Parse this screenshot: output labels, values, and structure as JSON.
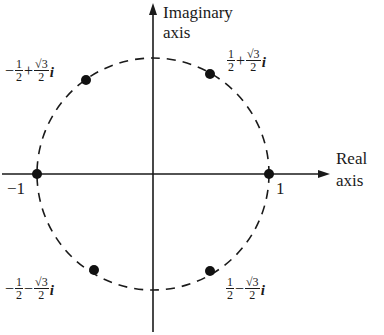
{
  "axes": {
    "imaginary_label_line1": "Imaginary",
    "imaginary_label_line2": "axis",
    "real_label_line1": "Real",
    "real_label_line2": "axis",
    "tick_neg_one": "−1",
    "tick_one": "1"
  },
  "points": [
    {
      "name": "upper-left",
      "real_sign": "−",
      "real_num": "1",
      "real_den": "2",
      "op": "+",
      "imag_num": "√3",
      "imag_den": "2",
      "i": "i"
    },
    {
      "name": "upper-right",
      "real_sign": "",
      "real_num": "1",
      "real_den": "2",
      "op": "+",
      "imag_num": "√3",
      "imag_den": "2",
      "i": "i"
    },
    {
      "name": "lower-left",
      "real_sign": "−",
      "real_num": "1",
      "real_den": "2",
      "op": "−",
      "imag_num": "√3",
      "imag_den": "2",
      "i": "i"
    },
    {
      "name": "lower-right",
      "real_sign": "",
      "real_num": "1",
      "real_den": "2",
      "op": "−",
      "imag_num": "√3",
      "imag_den": "2",
      "i": "i"
    }
  ],
  "colors": {
    "ink": "#1a1a1a",
    "background": "#ffffff"
  }
}
